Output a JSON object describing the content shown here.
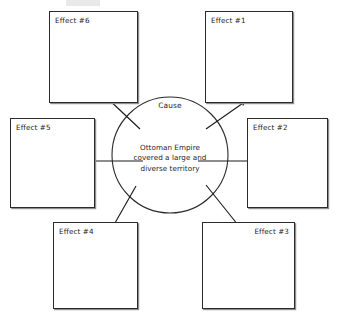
{
  "diagram": {
    "type": "cause-and-effect-web",
    "center": {
      "title": "Cause",
      "text_lines": [
        "Ottoman Empire",
        "covered a large and",
        "diverse territory"
      ],
      "text_full": "Ottoman Empire covered a large and diverse territory",
      "shape": "circle",
      "cx": 170,
      "cy": 155,
      "r": 58
    },
    "colors": {
      "stroke": "#2b2b2b",
      "shadow": "#8e8e8e",
      "text": "#1c1c1c",
      "background": "#ffffff"
    },
    "effects": [
      {
        "id": "effect-1",
        "label": "Effect #1",
        "position": "top-right",
        "label_align": "top-left",
        "x": 205,
        "y": 11,
        "w": 88,
        "h": 92
      },
      {
        "id": "effect-2",
        "label": "Effect #2",
        "position": "right",
        "label_align": "top-left",
        "x": 247,
        "y": 118,
        "w": 81,
        "h": 90
      },
      {
        "id": "effect-3",
        "label": "Effect #3",
        "position": "bottom-right",
        "label_align": "top-right",
        "x": 202,
        "y": 222,
        "w": 93,
        "h": 87
      },
      {
        "id": "effect-4",
        "label": "Effect #4",
        "position": "bottom-left",
        "label_align": "top-left",
        "x": 53,
        "y": 222,
        "w": 85,
        "h": 87
      },
      {
        "id": "effect-5",
        "label": "Effect #5",
        "position": "left",
        "label_align": "top-left",
        "x": 10,
        "y": 118,
        "w": 85,
        "h": 90
      },
      {
        "id": "effect-6",
        "label": "Effect #6",
        "position": "top-left",
        "label_align": "top-left",
        "x": 49,
        "y": 11,
        "w": 89,
        "h": 92
      }
    ],
    "arrows": [
      {
        "id": "arrow-to-effect-1",
        "from": [
          207,
          128
        ],
        "to": [
          247,
          100
        ],
        "direction": "up-right",
        "target": "effect-1"
      },
      {
        "id": "arrow-to-effect-2",
        "from": [
          198,
          161
        ],
        "to": [
          272,
          161
        ],
        "direction": "right",
        "target": "effect-2"
      },
      {
        "id": "arrow-to-effect-3",
        "from": [
          207,
          184
        ],
        "to": [
          243,
          231
        ],
        "direction": "down-right",
        "target": "effect-3"
      },
      {
        "id": "arrow-to-effect-4",
        "from": [
          135,
          185
        ],
        "to": [
          110,
          231
        ],
        "direction": "down-left",
        "target": "effect-4"
      },
      {
        "id": "arrow-to-effect-5",
        "from": [
          143,
          161
        ],
        "to": [
          82,
          161
        ],
        "direction": "left",
        "target": "effect-5"
      },
      {
        "id": "arrow-to-effect-6",
        "from": [
          139,
          128
        ],
        "to": [
          105,
          96
        ],
        "direction": "up-left",
        "target": "effect-6"
      }
    ]
  }
}
